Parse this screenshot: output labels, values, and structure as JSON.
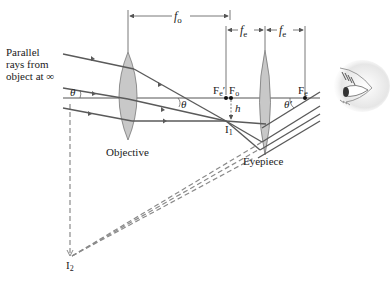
{
  "diagram": {
    "labels": {
      "incoming_rays": [
        "Parallel",
        "rays from",
        "object at ∞"
      ],
      "objective": "Objective",
      "eyepiece": "Eyepiece",
      "focal_objective": "f",
      "focal_objective_sub": "o",
      "focal_eyepiece": "f",
      "focal_eyepiece_sub": "e",
      "focal_eyepiece_2": "f",
      "focal_eyepiece_2_sub": "e",
      "theta_left": "θ",
      "theta_mid": "θ",
      "theta_prime": "θ′",
      "fe_prime": "F",
      "fe_prime_sub": "e",
      "fe_prime_mark": "′",
      "fo_point": "F",
      "fo_point_sub": "o",
      "fe_point": "F",
      "fe_point_sub": "e",
      "height": "h",
      "image1": "I",
      "image1_sub": "1",
      "image2": "I",
      "image2_sub": "2"
    },
    "colors": {
      "ray": "#5a5a5a",
      "lens_fill": "#c8c8c8",
      "lens_stroke": "#777777",
      "dim_line": "#555555",
      "dashed": "#8a8a8a",
      "text": "#1a1a1a"
    },
    "icons": {
      "viewer": "eye-icon"
    }
  }
}
